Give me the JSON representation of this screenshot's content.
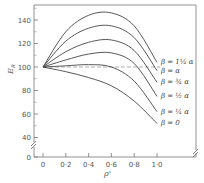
{
  "chart_data": {
    "type": "line",
    "title": "",
    "xlabel": "ρ'",
    "ylabel": "E_R",
    "xlim": [
      0,
      1.0
    ],
    "ylim": [
      0,
      150
    ],
    "y_axis_break": true,
    "x_axis_break": true,
    "grid": false,
    "x_ticks": [
      "0",
      "0·2",
      "0·4",
      "0·6",
      "0·8",
      "1·0"
    ],
    "y_ticks": [
      "0",
      "40",
      "60",
      "80",
      "100",
      "120",
      "140"
    ],
    "reference_line": {
      "y": 100,
      "style": "dashed"
    },
    "x": [
      0,
      0.2,
      0.4,
      0.6,
      0.8,
      1.0
    ],
    "series": [
      {
        "name": "β = 1¼ α",
        "values": [
          100,
          130,
          144,
          146,
          135,
          104
        ]
      },
      {
        "name": "β = α",
        "values": [
          100,
          122,
          133,
          135,
          125,
          97
        ]
      },
      {
        "name": "β = ¾ α",
        "values": [
          100,
          113,
          121,
          123,
          114,
          87
        ]
      },
      {
        "name": "β = ½ α",
        "values": [
          100,
          106,
          111,
          112,
          103,
          75
        ]
      },
      {
        "name": "β = ¼ α",
        "values": [
          100,
          101,
          102,
          100,
          88,
          62
        ]
      },
      {
        "name": "β = 0",
        "values": [
          100,
          96,
          91,
          84,
          71,
          52
        ]
      }
    ]
  },
  "labels": {
    "x_axis_title": "ρ'",
    "y_axis_title_main": "E",
    "y_axis_title_sub": "R",
    "curves": [
      "β = 1¼ α",
      "β = α",
      "β = ¾ α",
      "β = ½ α",
      "β = ¼ α",
      "β = 0"
    ]
  }
}
